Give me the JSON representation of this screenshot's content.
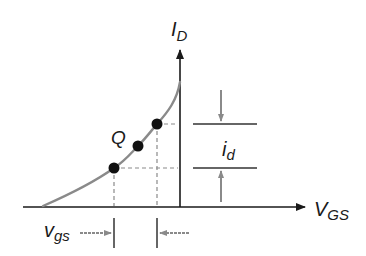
{
  "diagram": {
    "labels": {
      "y_axis_main": "I",
      "y_axis_sub": "D",
      "x_axis_main": "V",
      "x_axis_sub": "GS",
      "q_point": "Q",
      "id_main": "i",
      "id_sub": "d",
      "vgs_main": "v",
      "vgs_sub": "gs"
    },
    "colors": {
      "axis": "#1a1a1a",
      "curve": "#8a8a8a",
      "dashed": "#8a8a8a",
      "marker_arrow": "#8a8a8a",
      "points": "#111111",
      "marker_line": "#333333"
    },
    "points": [
      {
        "name": "lower",
        "x": 114,
        "y": 168
      },
      {
        "name": "Q",
        "x": 138,
        "y": 146
      },
      {
        "name": "upper",
        "x": 157,
        "y": 124
      }
    ]
  }
}
